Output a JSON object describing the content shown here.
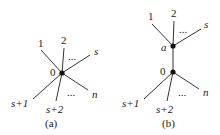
{
  "diagram": {
    "panels": [
      {
        "caption": "(a)",
        "center_label": "0",
        "upper_labels": {
          "l1": "1",
          "l2": "2",
          "ls": "s"
        },
        "lower_labels": {
          "l1": "s+1",
          "l2": "s+2",
          "ln": "n"
        },
        "ellipsis_upper": "...",
        "ellipsis_lower": "..."
      },
      {
        "caption": "(b)",
        "top_node_label": "a",
        "bottom_node_label": "0",
        "upper_labels": {
          "l1": "1",
          "l2": "2",
          "ls": "s"
        },
        "lower_labels": {
          "l1": "s+1",
          "l2": "s+2",
          "ln": "n"
        },
        "ellipsis_upper": "...",
        "ellipsis_lower": "..."
      }
    ],
    "colors": {
      "edge": "#333333",
      "node": "#111111",
      "text": "#1a1a1a"
    }
  }
}
